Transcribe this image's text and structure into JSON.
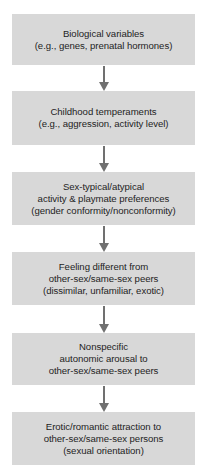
{
  "diagram": {
    "type": "flowchart",
    "direction": "top-to-bottom",
    "colors": {
      "box_fill": "#d8d8d8",
      "arrow": "#707070",
      "text": "#1e1e1e",
      "background": "#ffffff"
    },
    "nodes": [
      {
        "id": "biological-variables",
        "text": "Biological variables\n(e.g., genes, prenatal hormones)"
      },
      {
        "id": "childhood-temperaments",
        "text": "Childhood temperaments\n(e.g., aggression, activity level)"
      },
      {
        "id": "sex-typical-preferences",
        "text": "Sex-typical/atypical\nactivity & playmate preferences\n(gender conformity/nonconformity)"
      },
      {
        "id": "feeling-different",
        "text": "Feeling different from\nother-sex/same-sex peers\n(dissimilar, unfamiliar, exotic)"
      },
      {
        "id": "autonomic-arousal",
        "text": "Nonspecific\nautonomic arousal to\nother-sex/same-sex peers"
      },
      {
        "id": "erotic-attraction",
        "text": "Erotic/romantic attraction to\nother-sex/same-sex persons\n(sexual orientation)"
      }
    ],
    "edges": [
      {
        "from": "biological-variables",
        "to": "childhood-temperaments"
      },
      {
        "from": "childhood-temperaments",
        "to": "sex-typical-preferences"
      },
      {
        "from": "sex-typical-preferences",
        "to": "feeling-different"
      },
      {
        "from": "feeling-different",
        "to": "autonomic-arousal"
      },
      {
        "from": "autonomic-arousal",
        "to": "erotic-attraction"
      }
    ]
  }
}
